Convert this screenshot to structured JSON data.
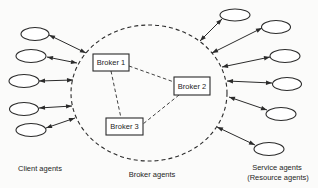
{
  "figure": {
    "bg_color": "#fbfbfa",
    "stroke_color": "#2b2b2b",
    "node_fill": "#ffffff",
    "canvas": {
      "width": 318,
      "height": 188
    }
  },
  "broker_group": {
    "caption": "Broker agents",
    "boundary": {
      "cx": 149,
      "cy": 93,
      "rx": 78,
      "ry": 68
    },
    "boxes": [
      {
        "label": "Broker 1",
        "x": 93,
        "y": 54,
        "w": 36,
        "h": 17
      },
      {
        "label": "Broker 2",
        "x": 174,
        "y": 77,
        "w": 36,
        "h": 18
      },
      {
        "label": "Broker 3",
        "x": 106,
        "y": 118,
        "w": 37,
        "h": 17
      }
    ],
    "links": [
      {
        "x1": 129,
        "y1": 66,
        "x2": 174,
        "y2": 82
      },
      {
        "x1": 111,
        "y1": 71,
        "x2": 121,
        "y2": 118
      },
      {
        "x1": 179,
        "y1": 95,
        "x2": 143,
        "y2": 124
      }
    ]
  },
  "client_agents": {
    "caption": "Client agents",
    "nodes": [
      {
        "cx": 35,
        "cy": 34,
        "rx": 14,
        "ry": 6.5
      },
      {
        "cx": 31,
        "cy": 56,
        "rx": 15,
        "ry": 6.5
      },
      {
        "cx": 24,
        "cy": 81,
        "rx": 15,
        "ry": 6.5
      },
      {
        "cx": 24,
        "cy": 109,
        "rx": 14.5,
        "ry": 6.5
      },
      {
        "cx": 31,
        "cy": 130,
        "rx": 15,
        "ry": 6.5
      }
    ],
    "links": [
      {
        "x1": 49,
        "y1": 35,
        "x2": 86,
        "y2": 53
      },
      {
        "x1": 47,
        "y1": 57,
        "x2": 77,
        "y2": 63
      },
      {
        "x1": 39,
        "y1": 81,
        "x2": 73,
        "y2": 80
      },
      {
        "x1": 39,
        "y1": 108,
        "x2": 72,
        "y2": 106
      },
      {
        "x1": 46,
        "y1": 128,
        "x2": 75,
        "y2": 118
      }
    ]
  },
  "service_agents": {
    "caption_line1": "Service agents",
    "caption_line2": "(Resource agents)",
    "nodes": [
      {
        "cx": 235,
        "cy": 15,
        "rx": 15,
        "ry": 6
      },
      {
        "cx": 276,
        "cy": 27,
        "rx": 14.5,
        "ry": 6.5
      },
      {
        "cx": 285,
        "cy": 56,
        "rx": 15,
        "ry": 6.5
      },
      {
        "cx": 287,
        "cy": 84,
        "rx": 14.5,
        "ry": 6.5
      },
      {
        "cx": 281,
        "cy": 114,
        "rx": 15,
        "ry": 6.5
      },
      {
        "cx": 269,
        "cy": 149,
        "rx": 15,
        "ry": 6.5
      }
    ],
    "links": [
      {
        "x1": 200,
        "y1": 41,
        "x2": 222,
        "y2": 19
      },
      {
        "x1": 212,
        "y1": 53,
        "x2": 262,
        "y2": 28
      },
      {
        "x1": 222,
        "y1": 67,
        "x2": 270,
        "y2": 57
      },
      {
        "x1": 227,
        "y1": 81,
        "x2": 272,
        "y2": 83
      },
      {
        "x1": 229,
        "y1": 97,
        "x2": 267,
        "y2": 110
      },
      {
        "x1": 217,
        "y1": 127,
        "x2": 255,
        "y2": 145
      }
    ]
  }
}
